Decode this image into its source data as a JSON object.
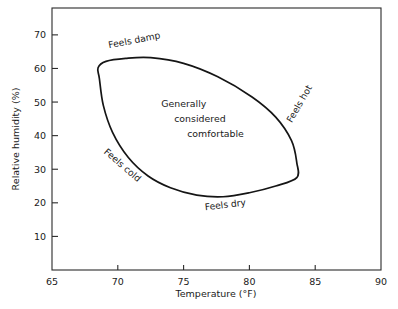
{
  "chart_data": {
    "type": "line",
    "title": "",
    "xlabel": "Temperature (°F)",
    "ylabel": "Relative humidity (%)",
    "xlim": [
      65,
      90
    ],
    "ylim": [
      0,
      78
    ],
    "grid": false,
    "legend": "none",
    "xticks": [
      65,
      70,
      75,
      80,
      85,
      90
    ],
    "xticklabels": [
      "65",
      "70",
      "75",
      "80",
      "85",
      "90"
    ],
    "yticks": [
      10,
      20,
      30,
      40,
      50,
      60,
      70
    ],
    "yticklabels": [
      "10",
      "20",
      "30",
      "40",
      "50",
      "60",
      "70"
    ],
    "series": [
      {
        "name": "Comfort zone boundary",
        "closed": true,
        "points": [
          [
            68.6,
            57.0
          ],
          [
            68.5,
            60.2
          ],
          [
            69.1,
            62.1
          ],
          [
            70.6,
            63.0
          ],
          [
            72.5,
            63.2
          ],
          [
            75.0,
            61.5
          ],
          [
            77.6,
            57.5
          ],
          [
            80.2,
            51.5
          ],
          [
            82.0,
            45.5
          ],
          [
            83.2,
            38.5
          ],
          [
            83.6,
            32.0
          ],
          [
            83.6,
            27.5
          ],
          [
            82.0,
            25.0
          ],
          [
            80.0,
            23.0
          ],
          [
            78.0,
            21.8
          ],
          [
            76.0,
            22.3
          ],
          [
            74.0,
            24.5
          ],
          [
            72.3,
            28.0
          ],
          [
            70.8,
            33.5
          ],
          [
            69.6,
            41.0
          ],
          [
            68.9,
            49.0
          ],
          [
            68.6,
            57.0
          ]
        ]
      }
    ],
    "annotations": [
      {
        "id": "feels-damp",
        "text": "Feels damp",
        "x": 71.3,
        "y": 67.5,
        "rotation": -11
      },
      {
        "id": "feels-hot",
        "text": "Feels hot",
        "x": 84.0,
        "y": 49.0,
        "rotation": -60
      },
      {
        "id": "feels-cold",
        "text": "Feels cold",
        "x": 70.2,
        "y": 30.5,
        "rotation": 41
      },
      {
        "id": "feels-dry",
        "text": "Feels dry",
        "x": 78.2,
        "y": 18.5,
        "rotation": -7
      }
    ],
    "center_label": {
      "lines": [
        "Generally",
        "considered",
        "comfortable"
      ]
    },
    "colors": {
      "background": "#ffffff",
      "axis": "#2a2a2a",
      "curve": "#151515",
      "text": "#1a1a1a"
    }
  }
}
